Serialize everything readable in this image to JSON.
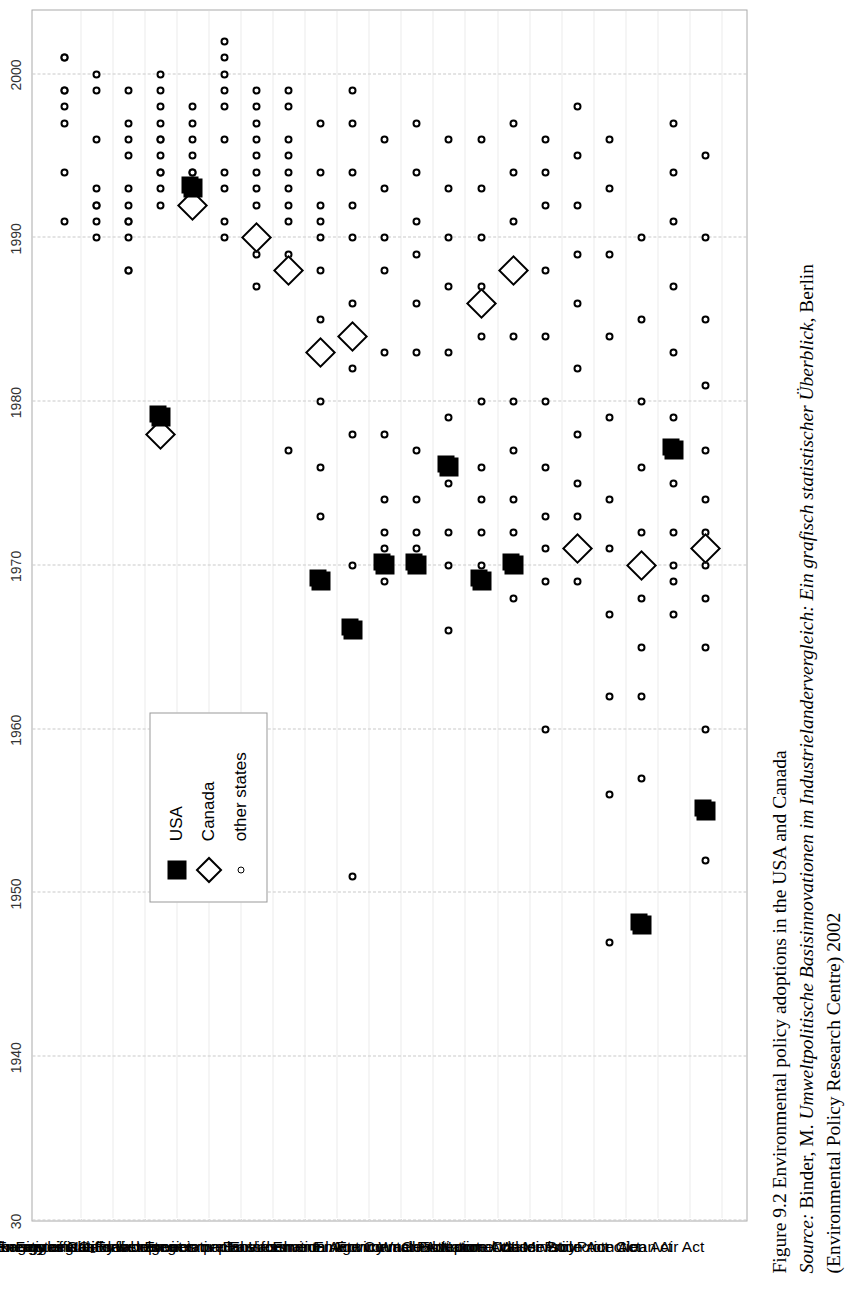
{
  "caption": {
    "line1_prefix": "Figure 9.2",
    "line1": "Figure 9.2   Environmental policy adoptions in the USA and Canada",
    "line2_label": "Source:",
    "line2_plain_a": " Binder, M. ",
    "line2_italic": "Umweltpolitische Basisinnovationen im Industrielandervergleich: Ein grafisch statistischer Überblick",
    "line2_plain_b": ", Berlin",
    "line3": "(Environmental Policy Research Centre) 2002"
  },
  "legend": {
    "items": [
      {
        "label": "USA",
        "marker": "filled-square"
      },
      {
        "label": "Canada",
        "marker": "open-diamond"
      },
      {
        "label": "other states",
        "marker": "small-open-circle"
      }
    ]
  },
  "chart_data": {
    "type": "scatter",
    "title": "Environmental policy adoptions in the USA and Canada",
    "xlabel": "",
    "ylabel": "",
    "xlim": [
      1930,
      2004
    ],
    "grid": true,
    "legend_position": "inside-left",
    "xtick_labels": [
      "30",
      "1940",
      "1950",
      "1960",
      "1970",
      "1980",
      "1990",
      "2000"
    ],
    "xticks": [
      1930,
      1940,
      1950,
      1960,
      1970,
      1980,
      1990,
      2000
    ],
    "categories": [
      "Quotas for regeneratives",
      "Eco-tax on energy or CO₂",
      "Packaging regulations",
      "Energy efficiency labels",
      "Council for sustainable development",
      "Feed-in-tariffs for regenerative",
      "National strategies or plans",
      "Eco-label",
      "Environment impact assessment",
      "Environmental Information Act",
      "Environmental Agency",
      "Environment Council",
      "Waste Act",
      "Environmental report",
      "Environmental Protection Act",
      "Constitutional clause",
      "Environmental Ministry",
      "Nature Conservation Act",
      "Water Protection Act",
      "Soil Protection Act",
      "Clean Air Act"
    ],
    "series": [
      {
        "name": "other states",
        "marker": "small-open-circle",
        "points": [
          {
            "cat": 0,
            "years": [
              1991,
              1994,
              1997,
              1998,
              1999,
              1999,
              2001,
              2001
            ]
          },
          {
            "cat": 1,
            "years": [
              1990,
              1991,
              1992,
              1992,
              1993,
              1996,
              1999,
              2000
            ]
          },
          {
            "cat": 2,
            "years": [
              1988,
              1988,
              1990,
              1991,
              1991,
              1992,
              1993,
              1995,
              1996,
              1997,
              1999
            ]
          },
          {
            "cat": 3,
            "years": [
              1992,
              1993,
              1994,
              1994,
              1995,
              1996,
              1996,
              1997,
              1998,
              1999,
              2000
            ]
          },
          {
            "cat": 4,
            "years": [
              1992,
              1993,
              1993,
              1994,
              1994,
              1995,
              1996,
              1997,
              1998
            ]
          },
          {
            "cat": 5,
            "years": [
              1990,
              1991,
              1993,
              1994,
              1996,
              1998,
              1999,
              2000,
              2001,
              2002
            ]
          },
          {
            "cat": 6,
            "years": [
              1987,
              1989,
              1990,
              1992,
              1993,
              1994,
              1995,
              1996,
              1997,
              1998,
              1999
            ]
          },
          {
            "cat": 7,
            "years": [
              1977,
              1988,
              1989,
              1991,
              1992,
              1993,
              1994,
              1995,
              1996,
              1998,
              1999
            ]
          },
          {
            "cat": 8,
            "years": [
              1969,
              1973,
              1976,
              1980,
              1985,
              1988,
              1990,
              1991,
              1992,
              1994,
              1997
            ]
          },
          {
            "cat": 9,
            "years": [
              1951,
              1966,
              1970,
              1978,
              1982,
              1986,
              1990,
              1992,
              1994,
              1997,
              1999
            ]
          },
          {
            "cat": 10,
            "years": [
              1969,
              1970,
              1971,
              1972,
              1974,
              1978,
              1983,
              1988,
              1990,
              1993,
              1996
            ]
          },
          {
            "cat": 11,
            "years": [
              1970,
              1971,
              1972,
              1974,
              1977,
              1983,
              1986,
              1989,
              1991,
              1994,
              1997
            ]
          },
          {
            "cat": 12,
            "years": [
              1966,
              1970,
              1972,
              1975,
              1976,
              1979,
              1983,
              1987,
              1990,
              1993,
              1996
            ]
          },
          {
            "cat": 13,
            "years": [
              1969,
              1970,
              1972,
              1974,
              1976,
              1980,
              1984,
              1987,
              1990,
              1993,
              1996
            ]
          },
          {
            "cat": 14,
            "years": [
              1968,
              1970,
              1972,
              1974,
              1977,
              1980,
              1984,
              1988,
              1991,
              1994,
              1997
            ]
          },
          {
            "cat": 15,
            "years": [
              1960,
              1969,
              1971,
              1973,
              1976,
              1980,
              1984,
              1988,
              1992,
              1994,
              1996
            ]
          },
          {
            "cat": 16,
            "years": [
              1969,
              1971,
              1973,
              1975,
              1978,
              1982,
              1986,
              1989,
              1992,
              1995,
              1998
            ]
          },
          {
            "cat": 17,
            "years": [
              1947,
              1956,
              1962,
              1967,
              1971,
              1974,
              1979,
              1984,
              1989,
              1993,
              1996
            ]
          },
          {
            "cat": 18,
            "years": [
              1948,
              1957,
              1962,
              1965,
              1968,
              1970,
              1972,
              1976,
              1980,
              1985,
              1990
            ]
          },
          {
            "cat": 19,
            "years": [
              1967,
              1969,
              1970,
              1972,
              1975,
              1979,
              1983,
              1987,
              1991,
              1994,
              1997
            ]
          },
          {
            "cat": 20,
            "years": [
              1952,
              1960,
              1965,
              1968,
              1970,
              1972,
              1974,
              1977,
              1981,
              1985,
              1990,
              1995
            ]
          }
        ]
      },
      {
        "name": "USA",
        "marker": "filled-square",
        "points": [
          {
            "cat": 4,
            "years": [
              1993
            ]
          },
          {
            "cat": 8,
            "years": [
              1969
            ]
          },
          {
            "cat": 9,
            "years": [
              1966
            ]
          },
          {
            "cat": 10,
            "years": [
              1970
            ]
          },
          {
            "cat": 11,
            "years": [
              1970
            ]
          },
          {
            "cat": 12,
            "years": [
              1976
            ]
          },
          {
            "cat": 13,
            "years": [
              1969
            ]
          },
          {
            "cat": 14,
            "years": [
              1970
            ]
          },
          {
            "cat": 18,
            "years": [
              1948
            ]
          },
          {
            "cat": 19,
            "years": [
              1977
            ]
          },
          {
            "cat": 20,
            "years": [
              1955
            ]
          },
          {
            "cat": 3,
            "years": [
              1979
            ]
          }
        ]
      },
      {
        "name": "Canada",
        "marker": "open-diamond",
        "points": [
          {
            "cat": 3,
            "years": [
              1978
            ]
          },
          {
            "cat": 4,
            "years": [
              1992
            ]
          },
          {
            "cat": 6,
            "years": [
              1990
            ]
          },
          {
            "cat": 7,
            "years": [
              1988
            ]
          },
          {
            "cat": 8,
            "years": [
              1983
            ]
          },
          {
            "cat": 9,
            "years": [
              1984
            ]
          },
          {
            "cat": 13,
            "years": [
              1986
            ]
          },
          {
            "cat": 14,
            "years": [
              1988
            ]
          },
          {
            "cat": 16,
            "years": [
              1971
            ]
          },
          {
            "cat": 18,
            "years": [
              1970
            ]
          },
          {
            "cat": 20,
            "years": [
              1971
            ]
          }
        ]
      }
    ]
  }
}
